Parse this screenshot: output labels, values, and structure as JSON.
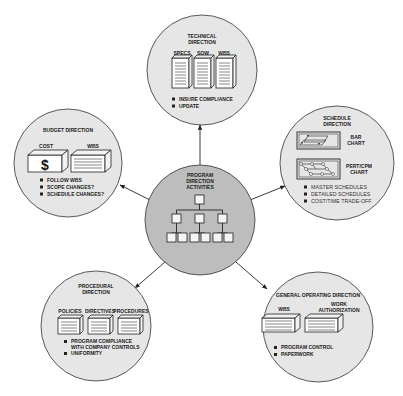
{
  "diagram": {
    "title": "Program Direction Activities",
    "center": {
      "title_lines": [
        "PROGRAM",
        "DIRECTION",
        "ACTIVITIES"
      ],
      "icon": "org-chart-icon"
    },
    "nodes": {
      "technical": {
        "title_lines": [
          "TECHNICAL",
          "DIRECTION"
        ],
        "documents": [
          "SPECS",
          "SOW",
          "WBS"
        ],
        "bullets": [
          "INSURE COMPLIANCE",
          "UPDATE"
        ]
      },
      "budget": {
        "title_lines": [
          "BUDGET DIRECTION"
        ],
        "boxes": [
          "COST",
          "WBS"
        ],
        "cost_symbol": "$",
        "bullets": [
          "FOLLOW WBS",
          "SCOPE CHANGES?",
          "SCHEDULE CHANGES?"
        ]
      },
      "schedule": {
        "title_lines": [
          "SCHEDULE",
          "DIRECTION"
        ],
        "charts": [
          {
            "label_lines": [
              "BAR",
              "CHART"
            ]
          },
          {
            "label_lines": [
              "PERT/CPM",
              "CHART"
            ]
          }
        ],
        "bullets": [
          "MASTER SCHEDULES",
          "DETAILED SCHEDULES",
          "COST/TIME TRADE-OFF"
        ]
      },
      "procedural": {
        "title_lines": [
          "PROCEDURAL",
          "DIRECTION"
        ],
        "boxes": [
          "POLICIES",
          "DIRECTIVES",
          "PROCEDURES"
        ],
        "bullets": [
          "PROGRAM COMPLIANCE",
          "WITH COMPANY CONTROLS",
          "UNIFORMITY"
        ]
      },
      "general": {
        "title_lines": [
          "GENERAL OPERATING DIRECTION"
        ],
        "boxes": [
          {
            "label_lines": [
              "WBS"
            ]
          },
          {
            "label_lines": [
              "WORK",
              "AUTHORIZATION"
            ]
          }
        ],
        "bullets": [
          "PROGRAM CONTROL",
          "PAPERWORK"
        ]
      }
    }
  }
}
